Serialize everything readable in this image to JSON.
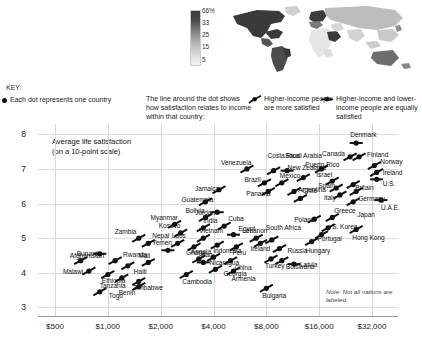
{
  "map": {
    "legend_title": "",
    "scale_labels": [
      "66%",
      "33",
      "25",
      "15",
      "5"
    ],
    "alt": "world-map-choropleth"
  },
  "key": {
    "title": "KEY:",
    "dot_text": "Each dot represents one country",
    "line_text": "The line around the dot shows how satisfaction relates to income within that country:",
    "higher_more": "Higher-income people are more satisfied",
    "equally": "Higher-income and lower-income people are equally satisfied"
  },
  "note": "Note: Not all nations are labeled.",
  "chart_data": {
    "type": "scatter",
    "title": "",
    "xlabel": "",
    "ylabel": "Average life satisfaction (on a 10-point scale)",
    "ylabel_line1": "Average life satisfaction",
    "ylabel_line2": "(on a 10-point scale)",
    "x_scale": "log2",
    "x_ticks": [
      "$500",
      "$1,000",
      "$2,000",
      "$4,000",
      "$8,000",
      "$16,000",
      "$32,000"
    ],
    "x_tick_values": [
      500,
      1000,
      2000,
      4000,
      8000,
      16000,
      32000
    ],
    "y_ticks": [
      "8",
      "7",
      "6",
      "5",
      "4",
      "3"
    ],
    "y_tick_values": [
      8,
      7,
      6,
      5,
      4,
      3
    ],
    "ylim": [
      2.75,
      8.3
    ],
    "xlim": [
      400,
      45000
    ],
    "grid": "both-light",
    "legend": "custom-key-above-plot",
    "points": [
      {
        "label": "Afghanistan",
        "x": 900,
        "y": 4.55,
        "slope": "flat",
        "lx": -30,
        "ly": 2
      },
      {
        "label": "Burundi",
        "x": 700,
        "y": 4.35,
        "slope": "up",
        "lx": -4,
        "ly": -7
      },
      {
        "label": "Malawi",
        "x": 780,
        "y": 4.05,
        "slope": "up",
        "lx": -26,
        "ly": 1
      },
      {
        "label": "Tanzania",
        "x": 1200,
        "y": 3.85,
        "slope": "up",
        "lx": -22,
        "ly": 8
      },
      {
        "label": "Zambia",
        "x": 1500,
        "y": 5.0,
        "slope": "up",
        "lx": -24,
        "ly": -6
      },
      {
        "label": "Yemen",
        "x": 2200,
        "y": 4.65,
        "slope": "flat",
        "lx": -16,
        "ly": -7
      },
      {
        "label": "Mali",
        "x": 1700,
        "y": 4.3,
        "slope": "up",
        "lx": -10,
        "ly": -6
      },
      {
        "label": "Ethiopia",
        "x": 1000,
        "y": 3.95,
        "slope": "up",
        "lx": -6,
        "ly": 7
      },
      {
        "label": "Benin",
        "x": 1500,
        "y": 3.6,
        "slope": "up",
        "lx": -20,
        "ly": 6
      },
      {
        "label": "Togo",
        "x": 900,
        "y": 3.45,
        "slope": "up",
        "lx": 9,
        "ly": 4
      },
      {
        "label": "Rwanda",
        "x": 1100,
        "y": 4.35,
        "slope": "up",
        "lx": 8,
        "ly": -6
      },
      {
        "label": "Haiti",
        "x": 1300,
        "y": 4.2,
        "slope": "up",
        "lx": 6,
        "ly": 6
      },
      {
        "label": "Zimbabwe",
        "x": 1500,
        "y": 3.75,
        "slope": "up",
        "lx": -6,
        "ly": 7
      },
      {
        "label": "Kosovo",
        "x": 2600,
        "y": 5.15,
        "slope": "up",
        "lx": -22,
        "ly": -7
      },
      {
        "label": "Nepal",
        "x": 1700,
        "y": 4.85,
        "slope": "up",
        "lx": 4,
        "ly": -7
      },
      {
        "label": "Laos",
        "x": 2500,
        "y": 4.85,
        "slope": "up",
        "lx": -6,
        "ly": -7
      },
      {
        "label": "Myanmar",
        "x": 2400,
        "y": 5.4,
        "slope": "up",
        "lx": -24,
        "ly": -6
      },
      {
        "label": "Angola",
        "x": 3300,
        "y": 4.4,
        "slope": "up",
        "lx": -8,
        "ly": -7
      },
      {
        "label": "Ghana",
        "x": 3100,
        "y": 4.75,
        "slope": "up",
        "lx": -8,
        "ly": 6
      },
      {
        "label": "Cambodia",
        "x": 2800,
        "y": 3.95,
        "slope": "up",
        "lx": -4,
        "ly": 8
      },
      {
        "label": "Georgia",
        "x": 4100,
        "y": 4.1,
        "slope": "up",
        "lx": 8,
        "ly": 5
      },
      {
        "label": "Iraq",
        "x": 3500,
        "y": 4.3,
        "slope": "flat",
        "lx": -2,
        "ly": -7
      },
      {
        "label": "Bolivia",
        "x": 3600,
        "y": 5.6,
        "slope": "up",
        "lx": -20,
        "ly": -6
      },
      {
        "label": "India",
        "x": 3500,
        "y": 5.3,
        "slope": "up",
        "lx": 0,
        "ly": -7
      },
      {
        "label": "Guatemala",
        "x": 3600,
        "y": 6.05,
        "slope": "up",
        "lx": -24,
        "ly": -2
      },
      {
        "label": "Jamaica",
        "x": 4300,
        "y": 6.4,
        "slope": "up",
        "lx": -24,
        "ly": -1
      },
      {
        "label": "Jordan",
        "x": 4200,
        "y": 5.75,
        "slope": "flat",
        "lx": -22,
        "ly": 1
      },
      {
        "label": "Vietnam",
        "x": 3500,
        "y": 5.0,
        "slope": "up",
        "lx": -4,
        "ly": -7
      },
      {
        "label": "Indonesia",
        "x": 4200,
        "y": 4.8,
        "slope": "up",
        "lx": -4,
        "ly": 6
      },
      {
        "label": "Nicaragua",
        "x": 4000,
        "y": 4.45,
        "slope": "up",
        "lx": -4,
        "ly": 6
      },
      {
        "label": "Cuba",
        "x": 4600,
        "y": 5.35,
        "slope": "up",
        "lx": 4,
        "ly": -7
      },
      {
        "label": "Egypt",
        "x": 5200,
        "y": 5.1,
        "slope": "flat",
        "lx": 5,
        "ly": -6
      },
      {
        "label": "Peru",
        "x": 5400,
        "y": 4.75,
        "slope": "up",
        "lx": -4,
        "ly": 6
      },
      {
        "label": "China",
        "x": 5000,
        "y": 4.35,
        "slope": "up",
        "lx": 4,
        "ly": 7
      },
      {
        "label": "Armenia",
        "x": 5200,
        "y": 4.05,
        "slope": "up",
        "lx": -2,
        "ly": 8
      },
      {
        "label": "Bulgaria",
        "x": 8000,
        "y": 3.55,
        "slope": "up",
        "lx": -4,
        "ly": 8
      },
      {
        "label": "Turkey",
        "x": 8500,
        "y": 4.4,
        "slope": "up",
        "lx": -6,
        "ly": 7
      },
      {
        "label": "Lebanon",
        "x": 7000,
        "y": 5.0,
        "slope": "up",
        "lx": -14,
        "ly": -7
      },
      {
        "label": "Ireland",
        "x": 7400,
        "y": 4.85,
        "slope": "up",
        "lx": -10,
        "ly": 6
      },
      {
        "label": "South Africa",
        "x": 8600,
        "y": 4.95,
        "slope": "up",
        "lx": -6,
        "ly": -12
      },
      {
        "label": "Russia",
        "x": 9500,
        "y": 4.7,
        "slope": "up",
        "lx": 8,
        "ly": 2
      },
      {
        "label": "Botswana",
        "x": 9800,
        "y": 4.35,
        "slope": "up",
        "lx": 4,
        "ly": 6
      },
      {
        "label": "Latvia",
        "x": 11500,
        "y": 4.25,
        "slope": "flat",
        "lx": 6,
        "ly": 1
      },
      {
        "label": "Venezuela",
        "x": 6200,
        "y": 7.0,
        "slope": "up",
        "lx": -26,
        "ly": -6
      },
      {
        "label": "Brazil",
        "x": 7800,
        "y": 6.6,
        "slope": "up",
        "lx": -20,
        "ly": -3
      },
      {
        "label": "Panama",
        "x": 8200,
        "y": 6.35,
        "slope": "up",
        "lx": -22,
        "ly": 3
      },
      {
        "label": "Costa Rica",
        "x": 8800,
        "y": 6.95,
        "slope": "up",
        "lx": -6,
        "ly": -15
      },
      {
        "label": "Saudi Arabia",
        "x": 10500,
        "y": 6.95,
        "slope": "flat",
        "lx": -2,
        "ly": -15
      },
      {
        "label": "Mexico",
        "x": 9800,
        "y": 6.6,
        "slope": "up",
        "lx": -2,
        "ly": -7
      },
      {
        "label": "Argentina",
        "x": 11500,
        "y": 6.35,
        "slope": "up",
        "lx": 4,
        "ly": -1
      },
      {
        "label": "Chile",
        "x": 12500,
        "y": 6.15,
        "slope": "up",
        "lx": 2,
        "ly": -7
      },
      {
        "label": "Puerto Rico",
        "x": 13000,
        "y": 6.75,
        "slope": "up",
        "lx": 2,
        "ly": -13
      },
      {
        "label": "New Zealand",
        "x": 16500,
        "y": 7.0,
        "slope": "up",
        "lx": -34,
        "ly": -1
      },
      {
        "label": "Israel",
        "x": 19000,
        "y": 6.65,
        "slope": "up",
        "lx": -16,
        "ly": -6
      },
      {
        "label": "Spain",
        "x": 20000,
        "y": 6.45,
        "slope": "up",
        "lx": -18,
        "ly": -2
      },
      {
        "label": "Italy",
        "x": 21000,
        "y": 6.25,
        "slope": "up",
        "lx": -16,
        "ly": 3
      },
      {
        "label": "Canada",
        "x": 24000,
        "y": 7.35,
        "slope": "up",
        "lx": -28,
        "ly": -3
      },
      {
        "label": "Denmark",
        "x": 26000,
        "y": 7.75,
        "slope": "flat",
        "lx": -6,
        "ly": -8
      },
      {
        "label": "Finland",
        "x": 27000,
        "y": 7.35,
        "slope": "up",
        "lx": 8,
        "ly": -2
      },
      {
        "label": "Norway",
        "x": 33000,
        "y": 7.1,
        "slope": "up",
        "lx": 6,
        "ly": -4
      },
      {
        "label": "Ireland",
        "x": 34000,
        "y": 6.9,
        "slope": "up",
        "lx": 6,
        "ly": 1
      },
      {
        "label": "U.S.",
        "x": 34000,
        "y": 6.7,
        "slope": "flat",
        "lx": 6,
        "ly": 5
      },
      {
        "label": "Britain",
        "x": 25000,
        "y": 6.55,
        "slope": "up",
        "lx": 2,
        "ly": 3
      },
      {
        "label": "Germany",
        "x": 26000,
        "y": 6.35,
        "slope": "up",
        "lx": 2,
        "ly": 8
      },
      {
        "label": "Japan",
        "x": 25000,
        "y": 6.05,
        "slope": "up",
        "lx": 4,
        "ly": 13
      },
      {
        "label": "U.A.E.",
        "x": 36000,
        "y": 6.1,
        "slope": "flat",
        "lx": 0,
        "ly": 8
      },
      {
        "label": "Greece",
        "x": 19000,
        "y": 5.6,
        "slope": "up",
        "lx": 2,
        "ly": -6
      },
      {
        "label": "S. Korea",
        "x": 18000,
        "y": 5.3,
        "slope": "up",
        "lx": 4,
        "ly": -1
      },
      {
        "label": "Poland",
        "x": 15000,
        "y": 5.55,
        "slope": "up",
        "lx": -20,
        "ly": 1
      },
      {
        "label": "Portugal",
        "x": 16500,
        "y": 5.1,
        "slope": "up",
        "lx": -4,
        "ly": 4
      },
      {
        "label": "Hungary",
        "x": 14500,
        "y": 4.9,
        "slope": "up",
        "lx": -6,
        "ly": 9
      },
      {
        "label": "Hong Kong",
        "x": 26000,
        "y": 5.25,
        "slope": "up",
        "lx": -4,
        "ly": 8
      }
    ]
  }
}
